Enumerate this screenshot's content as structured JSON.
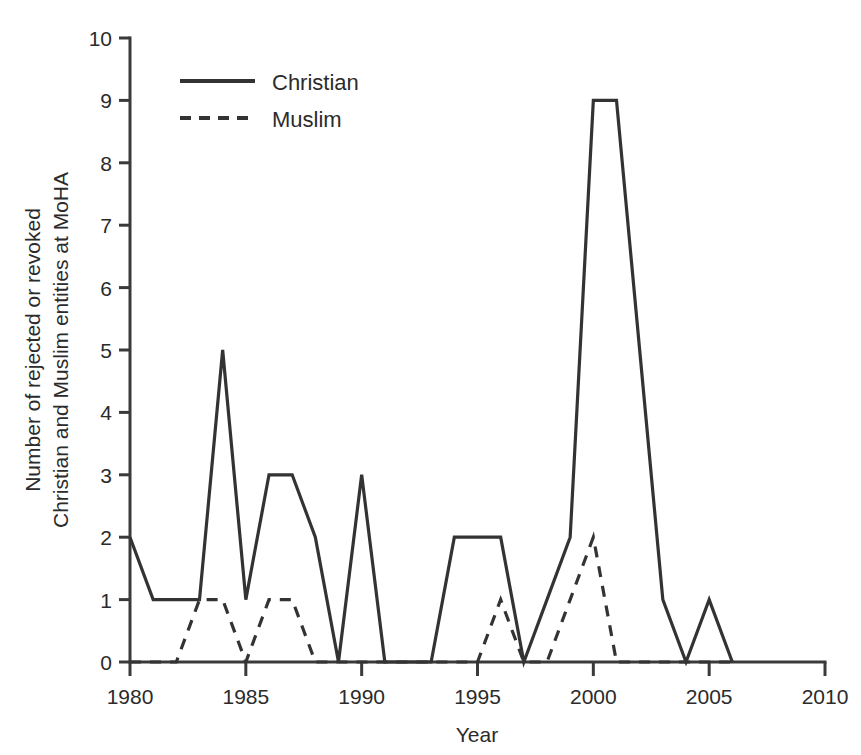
{
  "chart_data": {
    "type": "line",
    "title": "",
    "subtitle": "",
    "xlabel": "Year",
    "ylabel": "Number of rejected or revoked Christian and Muslim entities at MoHA",
    "ylabel_line1": "Number of rejected or revoked",
    "ylabel_line2": "Christian and Muslim entities at MoHA",
    "xlim": [
      1980,
      2010
    ],
    "ylim": [
      0,
      10
    ],
    "xticks": [
      1980,
      1985,
      1990,
      1995,
      2000,
      2005,
      2010
    ],
    "xtick_labels": [
      "1980",
      "1985",
      "1990",
      "1995",
      "2000",
      "2005",
      "2010"
    ],
    "yticks": [
      0,
      1,
      2,
      3,
      4,
      5,
      6,
      7,
      8,
      9,
      10
    ],
    "ytick_labels": [
      "0",
      "1",
      "2",
      "3",
      "4",
      "5",
      "6",
      "7",
      "8",
      "9",
      "10"
    ],
    "grid": false,
    "legend_position": "upper-left-inside",
    "x": [
      1980,
      1981,
      1982,
      1983,
      1984,
      1985,
      1986,
      1987,
      1988,
      1989,
      1990,
      1991,
      1992,
      1993,
      1994,
      1995,
      1996,
      1997,
      1998,
      1999,
      2000,
      2001,
      2002,
      2003,
      2004,
      2005,
      2006
    ],
    "series": [
      {
        "name": "Christian",
        "style": "solid",
        "color": "#333333",
        "values": [
          2,
          1,
          1,
          1,
          5,
          1,
          3,
          3,
          2,
          0,
          3,
          0,
          0,
          0,
          2,
          2,
          2,
          0,
          1,
          2,
          9,
          9,
          5,
          1,
          0,
          1,
          0
        ]
      },
      {
        "name": "Muslim",
        "style": "dashed",
        "color": "#333333",
        "values": [
          0,
          0,
          0,
          1,
          1,
          0,
          1,
          1,
          0,
          0,
          0,
          0,
          0,
          0,
          0,
          0,
          1,
          0,
          0,
          1,
          2,
          0,
          0,
          0,
          0,
          0,
          0
        ]
      }
    ],
    "legend": [
      {
        "label": "Christian",
        "style": "solid"
      },
      {
        "label": "Muslim",
        "style": "dashed"
      }
    ]
  }
}
